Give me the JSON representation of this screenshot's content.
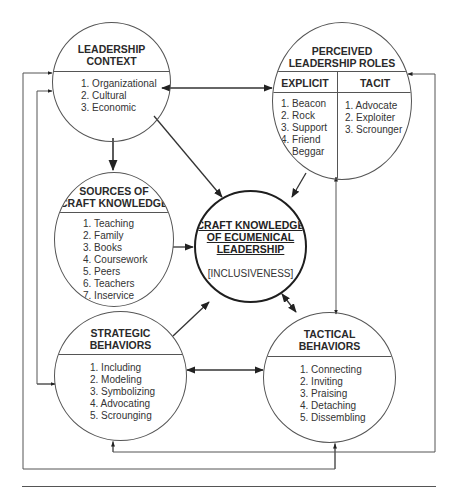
{
  "diagram": {
    "leadership_context": {
      "title_line1": "LEADERSHIP",
      "title_line2": "CONTEXT",
      "items": [
        "1. Organizational",
        "2. Cultural",
        "3. Economic"
      ]
    },
    "perceived_roles": {
      "title_line1": "PERCEIVED",
      "title_line2": "LEADERSHIP ROLES",
      "explicit": {
        "header": "EXPLICIT",
        "items": [
          "1. Beacon",
          "2. Rock",
          "3. Support",
          "4. Friend",
          "5. Beggar"
        ]
      },
      "tacit": {
        "header": "TACIT",
        "items": [
          "1. Advocate",
          "2. Exploiter",
          "3. Scrounger"
        ]
      }
    },
    "sources": {
      "title_line1": "SOURCES OF",
      "title_line2": "CRAFT KNOWLEDGE",
      "items": [
        "1. Teaching",
        "2. Family",
        "3. Books",
        "4. Coursework",
        "5. Peers",
        "6. Teachers",
        "7. Inservice"
      ]
    },
    "center": {
      "title_line1": "CRAFT KNOWLEDGE",
      "title_line2": "OF ECUMENICAL",
      "title_line3": "LEADERSHIP",
      "subtitle": "[INCLUSIVENESS]"
    },
    "strategic": {
      "title_line1": "STRATEGIC",
      "title_line2": "BEHAVIORS",
      "items": [
        "1. Including",
        "2. Modeling",
        "3. Symbolizing",
        "4. Advocating",
        "5. Scrounging"
      ]
    },
    "tactical": {
      "title_line1": "TACTICAL",
      "title_line2": "BEHAVIORS",
      "items": [
        "1. Connecting",
        "2. Inviting",
        "3. Praising",
        "4. Detaching",
        "5. Dissembling"
      ]
    },
    "connections": [
      {
        "from": "leadership_context",
        "to": "perceived_roles",
        "type": "bidirectional"
      },
      {
        "from": "leadership_context",
        "to": "sources",
        "type": "directed"
      },
      {
        "from": "leadership_context",
        "to": "center",
        "type": "directed"
      },
      {
        "from": "perceived_roles",
        "to": "center",
        "type": "directed"
      },
      {
        "from": "perceived_roles",
        "to": "tactical",
        "type": "bidirectional"
      },
      {
        "from": "sources",
        "to": "center",
        "type": "directed"
      },
      {
        "from": "strategic",
        "to": "center",
        "type": "directed"
      },
      {
        "from": "center",
        "to": "tactical",
        "type": "bidirectional"
      },
      {
        "from": "strategic",
        "to": "tactical",
        "type": "bidirectional"
      },
      {
        "from": "tactical",
        "to": "leadership_context",
        "type": "feedback"
      },
      {
        "from": "tactical",
        "to": "perceived_roles",
        "type": "feedback"
      },
      {
        "from": "strategic",
        "to": "leadership_context",
        "type": "feedback"
      },
      {
        "from": "perceived_roles",
        "to": "strategic",
        "type": "feedback"
      }
    ],
    "colors": {
      "line": "#555555",
      "arrow": "#222222",
      "center_border": "#1e1e1e",
      "text": "#2a2a2a"
    }
  }
}
